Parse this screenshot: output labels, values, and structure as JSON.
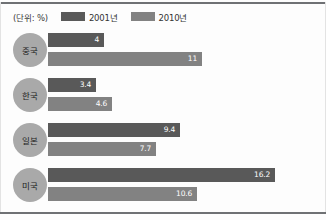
{
  "unit_label": "(단위: %)",
  "legend": [
    {
      "label": "2001년",
      "color": "#595959"
    },
    {
      "label": "2010년",
      "color": "#828282"
    }
  ],
  "chart_data": {
    "type": "bar",
    "orientation": "horizontal",
    "title": "",
    "subtitle": "",
    "xlabel": "",
    "ylabel": "",
    "unit": "%",
    "unit_note": "(단위: %)",
    "grid": false,
    "legend_position": "top-left",
    "categories": [
      "중국",
      "한국",
      "일본",
      "미국"
    ],
    "series": [
      {
        "name": "2001년",
        "color": "#595959",
        "values": [
          4,
          3.4,
          9.4,
          16.2
        ]
      },
      {
        "name": "2010년",
        "color": "#828282",
        "values": [
          11,
          4.6,
          7.7,
          10.6
        ]
      }
    ],
    "value_labels": [
      [
        "4",
        "11"
      ],
      [
        "3.4",
        "4.6"
      ],
      [
        "9.4",
        "7.7"
      ],
      [
        "16.2",
        "10.6"
      ]
    ],
    "xlim": [
      0,
      16.2
    ]
  }
}
